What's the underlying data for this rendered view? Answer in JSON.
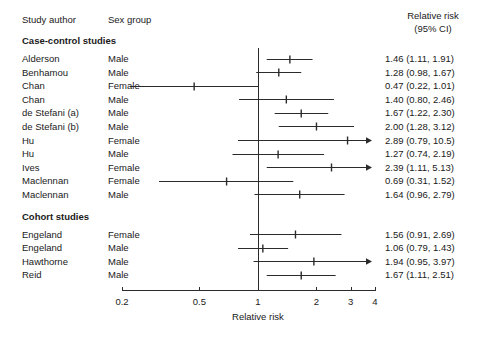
{
  "headers": {
    "author": "Study author",
    "sex": "Sex group",
    "rr_line1": "Relative risk",
    "rr_line2": "(95% CI)"
  },
  "groups": [
    {
      "label": "Case-control studies"
    },
    {
      "label": "Cohort studies"
    }
  ],
  "axis": {
    "title": "Relative risk",
    "scale": "log",
    "min": 0.2,
    "max": 4,
    "ticks": [
      {
        "value": 0.2,
        "label": "0.2"
      },
      {
        "value": 0.5,
        "label": "0.5"
      },
      {
        "value": 1,
        "label": "1"
      },
      {
        "value": 2,
        "label": "2"
      },
      {
        "value": 3,
        "label": "3"
      },
      {
        "value": 4,
        "label": "4"
      }
    ],
    "reference_line": 1
  },
  "colors": {
    "ink": "#1a1a1a",
    "line": "#2b2b2b",
    "background": "#ffffff"
  },
  "chart_data": {
    "type": "forest",
    "title": "",
    "xlabel": "Relative risk",
    "ylabel": "",
    "xscale": "log",
    "xlim": [
      0.2,
      4
    ],
    "grid": false,
    "legend": "none",
    "reference_line": 1,
    "columns": [
      "Study author",
      "Sex group",
      "Relative risk (95% CI)"
    ],
    "groups": [
      {
        "name": "Case-control studies",
        "rows": [
          {
            "author": "Alderson",
            "sex": "Male",
            "estimate": 1.46,
            "low": 1.11,
            "high": 1.91,
            "text": "1.46 (1.11, 1.91)",
            "truncated_high": false
          },
          {
            "author": "Benhamou",
            "sex": "Male",
            "estimate": 1.28,
            "low": 0.98,
            "high": 1.67,
            "text": "1.28 (0.98, 1.67)",
            "truncated_high": false
          },
          {
            "author": "Chan",
            "sex": "Female",
            "estimate": 0.47,
            "low": 0.22,
            "high": 1.01,
            "text": "0.47 (0.22, 1.01)",
            "truncated_high": false
          },
          {
            "author": "Chan",
            "sex": "Male",
            "estimate": 1.4,
            "low": 0.8,
            "high": 2.46,
            "text": "1.40 (0.80, 2.46)",
            "truncated_high": false
          },
          {
            "author": "de Stefani (a)",
            "sex": "Male",
            "estimate": 1.67,
            "low": 1.22,
            "high": 2.3,
            "text": "1.67 (1.22, 2.30)",
            "truncated_high": false
          },
          {
            "author": "de Stefani (b)",
            "sex": "Male",
            "estimate": 2.0,
            "low": 1.28,
            "high": 3.12,
            "text": "2.00 (1.28, 3.12)",
            "truncated_high": false
          },
          {
            "author": "Hu",
            "sex": "Female",
            "estimate": 2.89,
            "low": 0.79,
            "high": 10.5,
            "text": "2.89 (0.79, 10.5)",
            "truncated_high": true
          },
          {
            "author": "Hu",
            "sex": "Male",
            "estimate": 1.27,
            "low": 0.74,
            "high": 2.19,
            "text": "1.27 (0.74, 2.19)",
            "truncated_high": false
          },
          {
            "author": "Ives",
            "sex": "Female",
            "estimate": 2.39,
            "low": 1.11,
            "high": 5.13,
            "text": "2.39 (1.11, 5.13)",
            "truncated_high": true
          },
          {
            "author": "Maclennan",
            "sex": "Female",
            "estimate": 0.69,
            "low": 0.31,
            "high": 1.52,
            "text": "0.69 (0.31, 1.52)",
            "truncated_high": false
          },
          {
            "author": "Maclennan",
            "sex": "Male",
            "estimate": 1.64,
            "low": 0.96,
            "high": 2.79,
            "text": "1.64 (0.96, 2.79)",
            "truncated_high": false
          }
        ]
      },
      {
        "name": "Cohort studies",
        "rows": [
          {
            "author": "Engeland",
            "sex": "Female",
            "estimate": 1.56,
            "low": 0.91,
            "high": 2.69,
            "text": "1.56 (0.91, 2.69)",
            "truncated_high": false
          },
          {
            "author": "Engeland",
            "sex": "Male",
            "estimate": 1.06,
            "low": 0.79,
            "high": 1.43,
            "text": "1.06 (0.79, 1.43)",
            "truncated_high": false
          },
          {
            "author": "Hawthorne",
            "sex": "Male",
            "estimate": 1.94,
            "low": 0.95,
            "high": 3.97,
            "text": "1.94 (0.95, 3.97)",
            "truncated_high": true
          },
          {
            "author": "Reid",
            "sex": "Male",
            "estimate": 1.67,
            "low": 1.11,
            "high": 2.51,
            "text": "1.67 (1.11, 2.51)",
            "truncated_high": false
          }
        ]
      }
    ]
  }
}
